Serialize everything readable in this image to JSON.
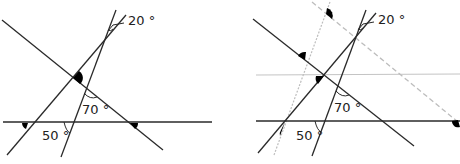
{
  "figures": [
    {
      "id": "left",
      "labels": {
        "angle_top": "20 °",
        "angle_mid": "70 °",
        "angle_bottom": "50 °"
      }
    },
    {
      "id": "right",
      "labels": {
        "angle_top": "20 °",
        "angle_mid": "70 °",
        "angle_bottom": "50 °"
      }
    }
  ],
  "colors": {
    "line": "#2a2a2a",
    "auxiliary": "#bdbdbd",
    "marker": "#000000"
  }
}
